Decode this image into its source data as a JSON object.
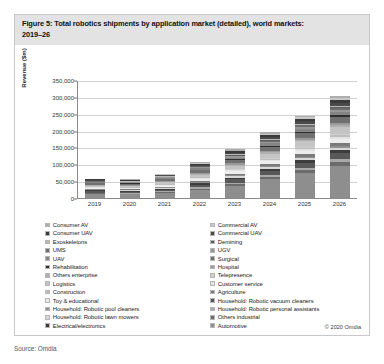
{
  "figure": {
    "title_line1": "Figure 5: Total robotics shipments by application market (detailed), world markets:",
    "title_line2": "2019–26",
    "credit": "© 2020 Omdia",
    "source": "Source: Omdia"
  },
  "chart_data": {
    "type": "bar",
    "title": "Figure 5: Total robotics shipments by application market (detailed), world markets: 2019–26",
    "xlabel": "",
    "ylabel": "Revenue ($m)",
    "ylim": [
      0,
      350000
    ],
    "yticks": [
      "0",
      "50,000",
      "100,000",
      "150,000",
      "200,000",
      "250,000",
      "300,000",
      "350,000"
    ],
    "ytick_values": [
      0,
      50000,
      100000,
      150000,
      200000,
      250000,
      300000,
      350000
    ],
    "grid": true,
    "stacked": true,
    "legend_position": "bottom",
    "categories": [
      "2019",
      "2020",
      "2021",
      "2022",
      "2023",
      "2024",
      "2025",
      "2026"
    ],
    "totals": [
      58000,
      56000,
      72000,
      108000,
      143000,
      192000,
      240000,
      298000
    ],
    "series": [
      {
        "name": "Automotive",
        "color": "#8e8e8e",
        "values": [
          12000,
          10500,
          14500,
          24000,
          36000,
          55000,
          74000,
          96000
        ]
      },
      {
        "name": "Others industrial",
        "color": "#6b6b6b",
        "values": [
          2600,
          2400,
          3000,
          4200,
          5200,
          6600,
          8000,
          9600
        ]
      },
      {
        "name": "Household: Robotic personal assistants",
        "color": "#a8a8a8",
        "values": [
          1500,
          1600,
          2200,
          3400,
          4600,
          6200,
          7800,
          9600
        ]
      },
      {
        "name": "Household: Robotic vacuum cleaners",
        "color": "#585858",
        "values": [
          4200,
          4400,
          5400,
          7400,
          9400,
          11800,
          14200,
          17000
        ]
      },
      {
        "name": "Electrical/electronics",
        "color": "#3d3d3d",
        "values": [
          2800,
          2600,
          3200,
          4400,
          5600,
          7000,
          8400,
          10000
        ]
      },
      {
        "name": "Household: Robotic lawn mowers",
        "color": "#d8d8d8",
        "values": [
          1400,
          1500,
          1900,
          2700,
          3500,
          4400,
          5300,
          6400
        ]
      },
      {
        "name": "Household: Robotic pool cleaners",
        "color": "#8f8f8f",
        "values": [
          1200,
          1250,
          1600,
          2300,
          3000,
          3800,
          4600,
          5500
        ]
      },
      {
        "name": "Agriculture",
        "color": "#7a7a7a",
        "values": [
          1800,
          1900,
          2500,
          3600,
          4800,
          6200,
          7600,
          9200
        ]
      },
      {
        "name": "Toy & educational",
        "color": "#ededed",
        "values": [
          3600,
          3500,
          4200,
          5600,
          7000,
          8800,
          10500,
          12500
        ]
      },
      {
        "name": "Customer service",
        "color": "#e2e2e2",
        "values": [
          900,
          950,
          1300,
          2000,
          2800,
          3700,
          4600,
          5700
        ]
      },
      {
        "name": "Construction",
        "color": "#bdbdbd",
        "values": [
          1100,
          1050,
          1400,
          2100,
          2800,
          3700,
          4500,
          5500
        ]
      },
      {
        "name": "Telepresence",
        "color": "#cfcfcf",
        "values": [
          700,
          750,
          1000,
          1500,
          2100,
          2800,
          3500,
          4300
        ]
      },
      {
        "name": "Logistics",
        "color": "#c4c4c4",
        "values": [
          3200,
          3300,
          4400,
          6600,
          9000,
          12000,
          15000,
          18500
        ]
      },
      {
        "name": "Others enterprise",
        "color": "#b0b0b0",
        "values": [
          1300,
          1250,
          1600,
          2400,
          3200,
          4200,
          5100,
          6200
        ]
      },
      {
        "name": "Hospital",
        "color": "#9a9a9a",
        "values": [
          1400,
          1450,
          1900,
          2800,
          3700,
          4800,
          5900,
          7200
        ]
      },
      {
        "name": "Surgical",
        "color": "#707070",
        "values": [
          4800,
          4600,
          5600,
          7600,
          9600,
          12000,
          14500,
          17500
        ]
      },
      {
        "name": "Rehabilitation",
        "color": "#2f2f2f",
        "values": [
          900,
          900,
          1200,
          1800,
          2400,
          3200,
          3900,
          4800
        ]
      },
      {
        "name": "UAV",
        "color": "#858585",
        "values": [
          2300,
          2200,
          2800,
          4000,
          5200,
          6600,
          8000,
          9600
        ]
      },
      {
        "name": "UGV",
        "color": "#979797",
        "values": [
          1600,
          1550,
          2000,
          2900,
          3800,
          4900,
          6000,
          7200
        ]
      },
      {
        "name": "UMS",
        "color": "#6e6e6e",
        "values": [
          1100,
          1050,
          1350,
          2000,
          2600,
          3400,
          4100,
          5000
        ]
      },
      {
        "name": "Demining",
        "color": "#5c5c5c",
        "values": [
          600,
          580,
          750,
          1100,
          1450,
          1900,
          2300,
          2800
        ]
      },
      {
        "name": "Exoskeletons",
        "color": "#b8b8b8",
        "values": [
          700,
          720,
          950,
          1400,
          1900,
          2500,
          3100,
          3800
        ]
      },
      {
        "name": "Commercial UAV",
        "color": "#4a4a4a",
        "values": [
          2100,
          2000,
          2600,
          3800,
          5000,
          6500,
          7900,
          9600
        ]
      },
      {
        "name": "Consumer UAV",
        "color": "#3a3a3a",
        "values": [
          1800,
          1700,
          2100,
          3000,
          3900,
          5000,
          6100,
          7400
        ]
      },
      {
        "name": "Commercial AV",
        "color": "#c8c8c8",
        "values": [
          1200,
          1150,
          1500,
          2200,
          2900,
          3800,
          4600,
          5600
        ]
      },
      {
        "name": "Consumer AV",
        "color": "#adadad",
        "values": [
          1400,
          1350,
          1750,
          2600,
          3400,
          4400,
          5400,
          6600
        ]
      }
    ]
  },
  "legend": {
    "left_column": [
      {
        "label": "Consumer AV",
        "color": "#adadad"
      },
      {
        "label": "Consumer UAV",
        "color": "#3a3a3a"
      },
      {
        "label": "Exoskeletons",
        "color": "#b8b8b8"
      },
      {
        "label": "UMS",
        "color": "#6e6e6e"
      },
      {
        "label": "UAV",
        "color": "#858585"
      },
      {
        "label": "Rehabilitation",
        "color": "#2f2f2f"
      },
      {
        "label": "Others enterprise",
        "color": "#b0b0b0"
      },
      {
        "label": "Logistics",
        "color": "#c4c4c4"
      },
      {
        "label": "Construction",
        "color": "#bdbdbd"
      },
      {
        "label": "Toy & educational",
        "color": "#ededed"
      },
      {
        "label": "Household: Robotic pool cleaners",
        "color": "#8f8f8f"
      },
      {
        "label": "Household: Robotic lawn mowers",
        "color": "#d8d8d8"
      },
      {
        "label": "Electrical/electronics",
        "color": "#3d3d3d"
      }
    ],
    "right_column": [
      {
        "label": "Commercial AV",
        "color": "#c8c8c8"
      },
      {
        "label": "Commercial UAV",
        "color": "#4a4a4a"
      },
      {
        "label": "Demining",
        "color": "#5c5c5c"
      },
      {
        "label": "UGV",
        "color": "#979797"
      },
      {
        "label": "Surgical",
        "color": "#707070"
      },
      {
        "label": "Hospital",
        "color": "#9a9a9a"
      },
      {
        "label": "Telepresence",
        "color": "#cfcfcf"
      },
      {
        "label": "Customer service",
        "color": "#e2e2e2"
      },
      {
        "label": "Agriculture",
        "color": "#7a7a7a"
      },
      {
        "label": "Household: Robotic vacuum cleaners",
        "color": "#585858"
      },
      {
        "label": "Household: Robotic personal assistants",
        "color": "#a8a8a8"
      },
      {
        "label": "Others industrial",
        "color": "#6b6b6b"
      },
      {
        "label": "Automotive",
        "color": "#8e8e8e"
      }
    ]
  }
}
